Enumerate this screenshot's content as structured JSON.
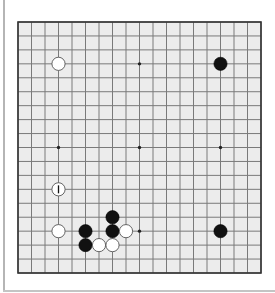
{
  "game": {
    "type": "go",
    "board_size": 19,
    "colors": {
      "board": "#ececec",
      "grid": "#7a7a7a",
      "border": "#333333",
      "black_stone": "#111111",
      "white_stone": "#ffffff",
      "white_stone_outline": "#555555",
      "star_point": "#222222"
    },
    "star_points": [
      [
        9,
        3
      ],
      [
        3,
        9
      ],
      [
        9,
        9
      ],
      [
        15,
        9
      ],
      [
        9,
        15
      ],
      [
        3,
        3
      ],
      [
        15,
        3
      ],
      [
        3,
        15
      ],
      [
        15,
        15
      ]
    ],
    "stones": [
      {
        "color": "white",
        "x": 3,
        "y": 3
      },
      {
        "color": "black",
        "x": 15,
        "y": 3
      },
      {
        "color": "white",
        "x": 3,
        "y": 12,
        "marker": "last-move-bar"
      },
      {
        "color": "white",
        "x": 3,
        "y": 15
      },
      {
        "color": "black",
        "x": 7,
        "y": 14
      },
      {
        "color": "black",
        "x": 5,
        "y": 15
      },
      {
        "color": "black",
        "x": 7,
        "y": 15
      },
      {
        "color": "white",
        "x": 8,
        "y": 15
      },
      {
        "color": "black",
        "x": 15,
        "y": 15
      },
      {
        "color": "black",
        "x": 5,
        "y": 16
      },
      {
        "color": "white",
        "x": 6,
        "y": 16
      },
      {
        "color": "white",
        "x": 7,
        "y": 16
      }
    ]
  }
}
